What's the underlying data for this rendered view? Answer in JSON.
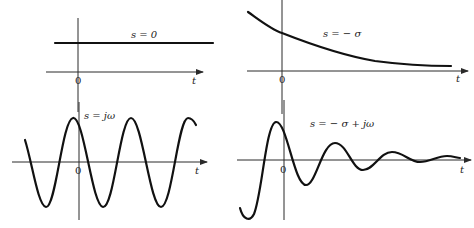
{
  "diagram": {
    "panels": [
      {
        "id": "top-left",
        "label": "s = 0",
        "origin_label": "0",
        "axis_label": "t",
        "curve_type": "constant"
      },
      {
        "id": "top-right",
        "label": "s = − σ",
        "origin_label": "0",
        "axis_label": "t",
        "curve_type": "exponential-decay"
      },
      {
        "id": "bottom-left",
        "label": "s = jω",
        "origin_label": "0",
        "axis_label": "t",
        "curve_type": "sinusoid"
      },
      {
        "id": "bottom-right",
        "label": "s = − σ + jω",
        "origin_label": "0",
        "axis_label": "t",
        "curve_type": "damped-sinusoid"
      }
    ],
    "colors": {
      "curve": "#111111",
      "axis": "#2a2a2a",
      "background": "#ffffff"
    }
  }
}
